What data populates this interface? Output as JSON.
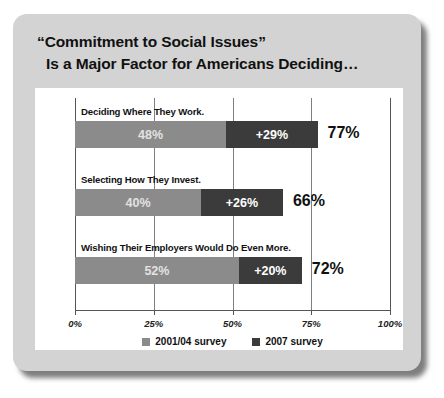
{
  "card": {
    "title_line1": "“Commitment to Social Issues”",
    "title_line2": "Is a Major Factor for Americans Deciding…"
  },
  "colors": {
    "card_background": "#d3d3d3",
    "panel_background": "#ffffff",
    "series_2001_04": "#8b8b8b",
    "series_2007": "#3b3b3b",
    "axis": "#555555",
    "text": "#111111"
  },
  "chart_data": {
    "type": "bar",
    "orientation": "horizontal",
    "stacked": true,
    "title": "“Commitment to Social Issues” Is a Major Factor for Americans Deciding…",
    "xlabel": "",
    "ylabel": "",
    "xlim": [
      0,
      100
    ],
    "xticks": [
      0,
      25,
      50,
      75,
      100
    ],
    "xtick_labels": [
      "0%",
      "25%",
      "50%",
      "75%",
      "100%"
    ],
    "grid": true,
    "legend_position": "bottom",
    "categories": [
      "Deciding Where They Work.",
      "Selecting How They Invest.",
      "Wishing Their Employers Would Do Even More."
    ],
    "series": [
      {
        "name": "2001/04 survey",
        "color": "#8b8b8b",
        "values": [
          48,
          40,
          52
        ],
        "labels": [
          "48%",
          "40%",
          "52%"
        ]
      },
      {
        "name": "2007 survey",
        "color": "#3b3b3b",
        "values": [
          29,
          26,
          20
        ],
        "labels": [
          "+29%",
          "+26%",
          "+20%"
        ]
      }
    ],
    "totals": [
      77,
      66,
      72
    ],
    "total_labels": [
      "77%",
      "66%",
      "72%"
    ]
  },
  "legend": [
    {
      "label": "2001/04 survey",
      "color": "#8b8b8b"
    },
    {
      "label": "2007 survey",
      "color": "#3b3b3b"
    }
  ],
  "groups": [
    {
      "category": "Deciding Where They Work.",
      "seg_a_label": "48%",
      "seg_b_label": "+29%",
      "total_label": "77%"
    },
    {
      "category": "Selecting How They Invest.",
      "seg_a_label": "40%",
      "seg_b_label": "+26%",
      "total_label": "66%"
    },
    {
      "category": "Wishing Their Employers Would Do Even More.",
      "seg_a_label": "52%",
      "seg_b_label": "+20%",
      "total_label": "72%"
    }
  ],
  "xticks": [
    {
      "label": "0%",
      "value": 0
    },
    {
      "label": "25%",
      "value": 25
    },
    {
      "label": "50%",
      "value": 50
    },
    {
      "label": "75%",
      "value": 75
    },
    {
      "label": "100%",
      "value": 100
    }
  ]
}
